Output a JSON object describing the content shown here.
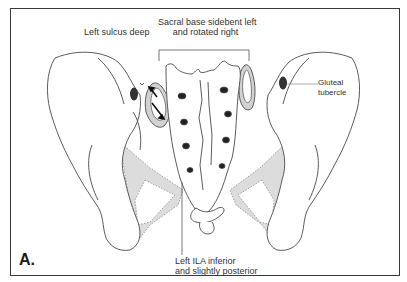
{
  "figure": {
    "panel_letter": "A.",
    "colors": {
      "outline": "#4a4a4a",
      "shading": "#d9d9d9",
      "dark_mark": "#333333",
      "frame": "#3a3a3a"
    }
  },
  "labels": {
    "left_sulcus": "Left sulcus deep",
    "sacral_base_line1": "Sacral base sidebent left",
    "sacral_base_line2": "and rotated right",
    "gluteal_line1": "Gluteal",
    "gluteal_line2": "tubercle",
    "ila_line1": "Left ILA inferior",
    "ila_line2": "and slightly posterior"
  },
  "icons": {
    "arrow_up": "arrow-up-left",
    "arrow_down": "arrow-down-right"
  }
}
